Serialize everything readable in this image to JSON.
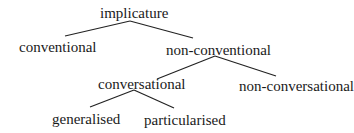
{
  "tree": {
    "root": "implicature",
    "level1": {
      "left": "conventional",
      "right": "non-conventional"
    },
    "level2": {
      "left": "conversational",
      "right": "non-conversational"
    },
    "level3": {
      "left": "generalised",
      "right": "particularised"
    }
  },
  "colors": {
    "text": "#1a1a1a",
    "lines": "#222222",
    "background": "#ffffff"
  }
}
